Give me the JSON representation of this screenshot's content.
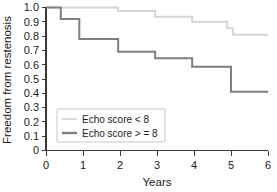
{
  "chart_data": {
    "type": "line",
    "title": "",
    "subtitle": "",
    "xlabel": "Years",
    "ylabel": "Freedom from restenosis",
    "xlim": [
      0,
      6
    ],
    "ylim": [
      0,
      1.0
    ],
    "xticks": [
      "0",
      "1",
      "2",
      "3",
      "4",
      "5",
      "6"
    ],
    "xtick_values": [
      0,
      1,
      2,
      3,
      4,
      5,
      6
    ],
    "yticks": [
      "0",
      "0.1",
      "0.2",
      "0.3",
      "0.4",
      "0.5",
      "0.6",
      "0.7",
      "0.8",
      "0.9",
      "1.0"
    ],
    "ytick_values": [
      0,
      0.1,
      0.2,
      0.3,
      0.4,
      0.5,
      0.6,
      0.7,
      0.8,
      0.9,
      1.0
    ],
    "grid": false,
    "legend_position": "lower-left",
    "style": "kaplan-meier step",
    "series": [
      {
        "name": "Echo score < 8",
        "color": "#d6d6d6",
        "linewidth": 2.0,
        "x": [
          0,
          1.95,
          1.95,
          2.95,
          2.95,
          3.95,
          3.95,
          4.9,
          4.9,
          5.05,
          5.05,
          6.0
        ],
        "y": [
          1.0,
          1.0,
          0.975,
          0.975,
          0.935,
          0.935,
          0.9,
          0.9,
          0.855,
          0.855,
          0.81,
          0.81
        ],
        "steps": [
          {
            "time": 0.0,
            "value": 1.0
          },
          {
            "time": 1.95,
            "value": 0.975
          },
          {
            "time": 2.95,
            "value": 0.935
          },
          {
            "time": 3.95,
            "value": 0.9
          },
          {
            "time": 4.9,
            "value": 0.855
          },
          {
            "time": 5.05,
            "value": 0.81
          },
          {
            "time": 6.0,
            "value": 0.81
          }
        ]
      },
      {
        "name": "Echo score > = 8",
        "color": "#7f7f7f",
        "linewidth": 2.0,
        "x": [
          0,
          0.4,
          0.4,
          0.9,
          0.9,
          1.95,
          1.95,
          2.95,
          2.95,
          3.95,
          3.95,
          5.0,
          5.0,
          6.0
        ],
        "y": [
          1.0,
          1.0,
          0.92,
          0.92,
          0.78,
          0.78,
          0.69,
          0.69,
          0.645,
          0.645,
          0.585,
          0.585,
          0.41,
          0.41
        ],
        "steps": [
          {
            "time": 0.0,
            "value": 1.0
          },
          {
            "time": 0.4,
            "value": 0.92
          },
          {
            "time": 0.9,
            "value": 0.78
          },
          {
            "time": 1.95,
            "value": 0.69
          },
          {
            "time": 2.95,
            "value": 0.645
          },
          {
            "time": 3.95,
            "value": 0.585
          },
          {
            "time": 5.0,
            "value": 0.41
          },
          {
            "time": 6.0,
            "value": 0.41
          }
        ]
      }
    ]
  },
  "legend": {
    "entries": [
      {
        "label": "Echo score < 8",
        "color": "#d6d6d6"
      },
      {
        "label": "Echo score > = 8",
        "color": "#7f7f7f"
      }
    ]
  },
  "axes": {
    "y_title": "Freedom from restenosis",
    "x_title": "Years",
    "y_tick_labels": [
      "1.0",
      "0.9",
      "0.8",
      "0.7",
      "0.6",
      "0.5",
      "0.4",
      "0.3",
      "0.2",
      "0.1",
      "0"
    ],
    "x_tick_labels": [
      "0",
      "1",
      "2",
      "3",
      "4",
      "5",
      "6"
    ]
  },
  "colors": {
    "axis": "#3a3a3a",
    "text": "#1b1b1b",
    "series_light": "#d6d6d6",
    "series_dark": "#7f7f7f",
    "legend_border": "#c8c8c8",
    "background": "#ffffff"
  }
}
